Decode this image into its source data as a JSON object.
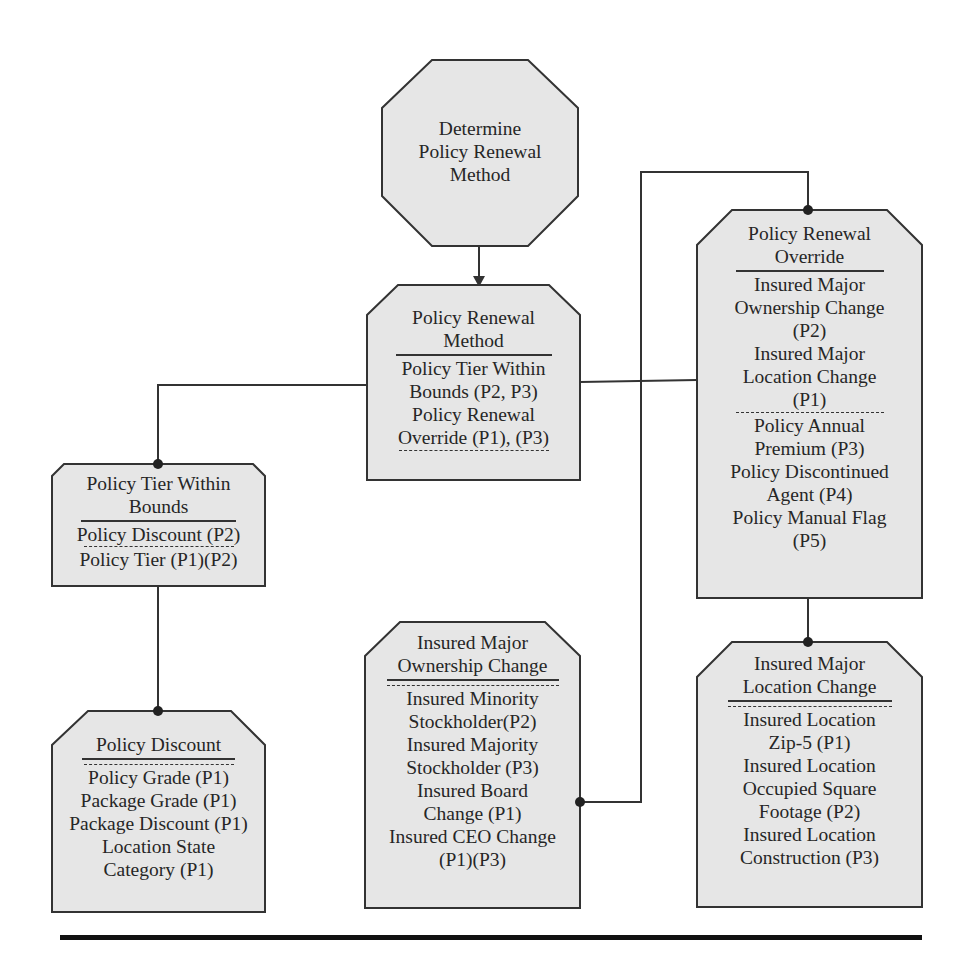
{
  "diagram": {
    "colors": {
      "box_fill": "#e6e6e6",
      "stroke": "#333333",
      "background": "#ffffff"
    },
    "start_node": {
      "shape": "octagon",
      "label_lines": [
        "Determine",
        "Policy Renewal",
        "Method"
      ]
    },
    "nodes": {
      "policy_renewal_method": {
        "title_lines": [
          "Policy Renewal",
          "Method"
        ],
        "primary_items": [
          "Policy Tier Within",
          "Bounds (P2, P3)",
          "Policy Renewal",
          "Override (P1), (P3)"
        ],
        "secondary_items": []
      },
      "policy_tier_within_bounds": {
        "title_lines": [
          "Policy Tier Within",
          "Bounds"
        ],
        "primary_items": [
          "Policy Discount (P2)"
        ],
        "secondary_items": [
          "Policy Tier (P1)(P2)"
        ]
      },
      "policy_discount": {
        "title_lines": [
          "Policy Discount"
        ],
        "primary_items": [],
        "secondary_items": [
          "Policy Grade (P1)",
          "Package Grade (P1)",
          "Package Discount (P1)",
          "Location State",
          "Category (P1)"
        ]
      },
      "insured_major_ownership_change": {
        "title_lines": [
          "Insured Major",
          "Ownership Change"
        ],
        "primary_items": [],
        "secondary_items": [
          "Insured Minority",
          "Stockholder(P2)",
          "Insured Majority",
          "Stockholder (P3)",
          "Insured Board",
          "Change (P1)",
          "Insured CEO Change",
          "(P1)(P3)"
        ]
      },
      "policy_renewal_override": {
        "title_lines": [
          "Policy Renewal",
          "Override"
        ],
        "primary_items": [
          "Insured Major",
          "Ownership Change",
          "(P2)",
          "Insured Major",
          "Location Change",
          "(P1)"
        ],
        "secondary_items": [
          "Policy Annual",
          "Premium (P3)",
          "Policy Discontinued",
          "Agent (P4)",
          "Policy Manual Flag",
          "(P5)"
        ]
      },
      "insured_major_location_change": {
        "title_lines": [
          "Insured Major",
          "Location Change"
        ],
        "primary_items": [],
        "secondary_items": [
          "Insured Location",
          "Zip-5 (P1)",
          "Insured Location",
          "Occupied Square",
          "Footage (P2)",
          "Insured Location",
          "Construction (P3)"
        ]
      }
    },
    "edges": [
      {
        "from": "Determine Policy Renewal Method",
        "to": "Policy Renewal Method",
        "type": "arrow"
      },
      {
        "from": "Policy Renewal Method",
        "to": "Policy Tier Within Bounds",
        "type": "dot"
      },
      {
        "from": "Policy Renewal Method",
        "to": "Policy Renewal Override",
        "type": "dot"
      },
      {
        "from": "Policy Tier Within Bounds",
        "to": "Policy Discount",
        "type": "dot"
      },
      {
        "from": "Insured Major Ownership Change",
        "to": "Policy Renewal Override",
        "type": "dot"
      },
      {
        "from": "Policy Renewal Override",
        "to": "Insured Major Location Change",
        "type": "dot"
      }
    ]
  }
}
